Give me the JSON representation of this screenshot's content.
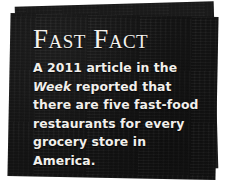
{
  "callout": {
    "title": "Fast Fact",
    "body": {
      "before_source": "A 2011 article in the",
      "source": "Week",
      "after_source": "reported that there are five fast-food restaurants for every grocery store in America.",
      "full_text": "A 2011 article in the Week reported that there are five fast-food restaurants for every grocery store in America.",
      "lines": [
        "A 2011 article in the Week",
        "reported that there are",
        "five fast-food restaurants",
        "for every grocery store in",
        "America."
      ]
    },
    "colors": {
      "panel_front": "#151515",
      "panel_back": "#1b1b1b",
      "text": "#f2f0ec",
      "page_background": "#ffffff"
    }
  }
}
